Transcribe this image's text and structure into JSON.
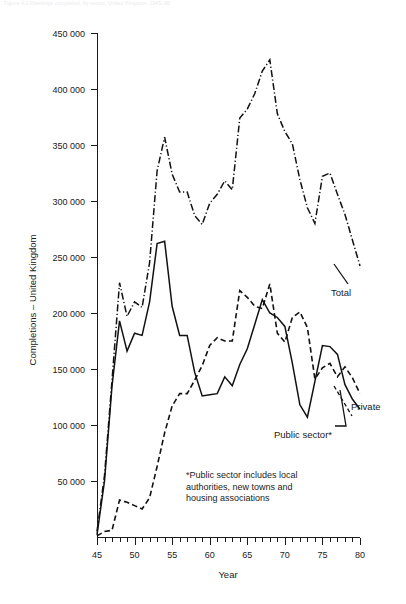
{
  "figure": {
    "caption": "Figure 4.2  Dwellings completed, by sector, United Kingdom, 1945–80"
  },
  "chart_data": {
    "type": "line",
    "title": "",
    "xlabel": "Year",
    "ylabel": "Completions – United Kingdom",
    "xlim": [
      45,
      80
    ],
    "ylim": [
      0,
      450000
    ],
    "grid": false,
    "legend_position": "inline-annotations",
    "x_tick_labels": [
      "45",
      "50",
      "55",
      "60",
      "65",
      "70",
      "75",
      "80"
    ],
    "x_ticks_major": [
      45,
      50,
      55,
      60,
      65,
      70,
      75,
      80
    ],
    "x_minor_tick_interval": 1,
    "y_tick_labels": [
      "50 000",
      "100 000",
      "150 000",
      "200 000",
      "250 000",
      "300 000",
      "350 000",
      "400 000",
      "450 000"
    ],
    "y_ticks": [
      50000,
      100000,
      150000,
      200000,
      250000,
      300000,
      350000,
      400000,
      450000
    ],
    "x": [
      45,
      46,
      47,
      48,
      49,
      50,
      51,
      52,
      53,
      54,
      55,
      56,
      57,
      58,
      59,
      60,
      61,
      62,
      63,
      64,
      65,
      66,
      67,
      68,
      69,
      70,
      71,
      72,
      73,
      74,
      75,
      76,
      77,
      78,
      79,
      80
    ],
    "series": [
      {
        "name": "Total",
        "style": "dash-dot",
        "values": [
          5000,
          55000,
          140000,
          227000,
          197000,
          210000,
          205000,
          245000,
          327000,
          357000,
          324000,
          308000,
          308000,
          287000,
          279000,
          298000,
          306000,
          318000,
          310000,
          374000,
          382000,
          396000,
          416000,
          426000,
          378000,
          362000,
          351000,
          319000,
          294000,
          280000,
          322000,
          325000,
          306000,
          288000,
          265000,
          242000
        ]
      },
      {
        "name": "Private",
        "style": "dashed",
        "values": [
          1000,
          5000,
          6000,
          33000,
          31000,
          28000,
          25000,
          35000,
          63000,
          93000,
          117000,
          128000,
          128000,
          140000,
          153000,
          171000,
          178000,
          175000,
          175000,
          220000,
          214000,
          206000,
          204000,
          226000,
          182000,
          174000,
          196000,
          201000,
          187000,
          141000,
          151000,
          155000,
          143000,
          152000,
          142000,
          128000
        ]
      },
      {
        "name": "Public sector*",
        "style": "solid",
        "values": [
          2000,
          50000,
          135000,
          193000,
          166000,
          182000,
          180000,
          210000,
          262000,
          264000,
          206000,
          180000,
          180000,
          147000,
          126000,
          127000,
          128000,
          143000,
          135000,
          154000,
          168000,
          190000,
          212000,
          200000,
          196000,
          188000,
          155000,
          118000,
          107000,
          139000,
          171000,
          170000,
          163000,
          136000,
          123000,
          114000
        ]
      }
    ],
    "annotations": [
      {
        "name": "Total",
        "text": "Total"
      },
      {
        "name": "Private",
        "text": "Private"
      },
      {
        "name": "Public sector",
        "text": "Public sector*"
      }
    ],
    "footnote_lines": [
      "*Public sector includes local",
      "authorities, new towns and",
      "housing associations"
    ]
  }
}
